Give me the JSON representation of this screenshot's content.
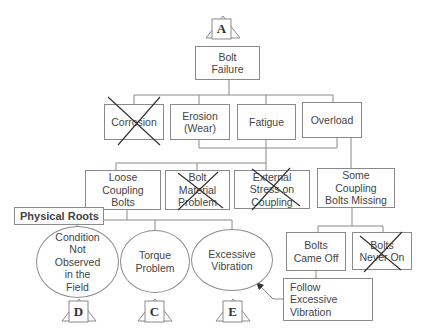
{
  "diagram": {
    "type": "fault-tree",
    "top_event": {
      "label": "Bolt\nFailure",
      "transfer_in": "A"
    },
    "level1": [
      {
        "label": "Corrosion",
        "eliminated": true
      },
      {
        "label": "Erosion\n(Wear)",
        "eliminated": false
      },
      {
        "label": "Fatigue",
        "eliminated": false
      },
      {
        "label": "Overload",
        "eliminated": false
      }
    ],
    "level2": [
      {
        "label": "Loose\nCoupling\nBolts",
        "eliminated": false
      },
      {
        "label": "Bolt\nMaterial\nProblem",
        "eliminated": true
      },
      {
        "label": "External\nStress on\nCoupling",
        "eliminated": true
      },
      {
        "label": "Some\nCoupling\nBolts Missing",
        "eliminated": false
      }
    ],
    "section_label": "Physical Roots",
    "physical_roots": [
      {
        "label": "Condition\nNot\nObserved\nin the\nField",
        "transfer": "D"
      },
      {
        "label": "Torque\nProblem",
        "transfer": "C"
      },
      {
        "label": "Excessive\nVibration",
        "transfer": "E"
      }
    ],
    "level3_missing": [
      {
        "label": "Bolts\nCame Off",
        "eliminated": false
      },
      {
        "label": "Bolts\nNever On",
        "eliminated": true
      }
    ],
    "note": {
      "label": "Follow\nExcessive\nVibration",
      "points_to": "Excessive Vibration"
    }
  }
}
